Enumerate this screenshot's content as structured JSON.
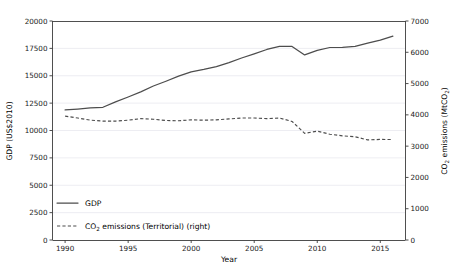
{
  "chart_data": {
    "type": "line",
    "title": "",
    "xlabel": "Year",
    "ylabel": "GDP (US$2010)",
    "y2label": "CO2 emissions (MtCO2)",
    "ylabel_parts": {
      "main": "GDP (US$2010)"
    },
    "y2label_parts": {
      "pre": "CO",
      "sub1": "2",
      "mid": " emissions (MtCO",
      "sub2": "2",
      "post": ")"
    },
    "grid": true,
    "legend_position": "lower left",
    "xlim": [
      1989,
      2017
    ],
    "ylim": [
      0,
      20000
    ],
    "y2lim": [
      0,
      7000
    ],
    "xticks": [
      1990,
      1995,
      2000,
      2005,
      2010,
      2015
    ],
    "xtick_labels": [
      "1990",
      "1995",
      "2000",
      "2005",
      "2010",
      "2015"
    ],
    "yticks": [
      0,
      2500,
      5000,
      7500,
      10000,
      12500,
      15000,
      17500,
      20000
    ],
    "ytick_labels": [
      "0",
      "2500",
      "5000",
      "7500",
      "10000",
      "12500",
      "15000",
      "17500",
      "20000"
    ],
    "y2ticks": [
      0,
      1000,
      2000,
      3000,
      4000,
      5000,
      6000,
      7000
    ],
    "y2tick_labels": [
      "0",
      "1000",
      "2000",
      "3000",
      "4000",
      "5000",
      "6000",
      "7000"
    ],
    "x": [
      1990,
      1991,
      1992,
      1993,
      1994,
      1995,
      1996,
      1997,
      1998,
      1999,
      2000,
      2001,
      2002,
      2003,
      2004,
      2005,
      2006,
      2007,
      2008,
      2009,
      2010,
      2011,
      2012,
      2013,
      2014,
      2015,
      2016
    ],
    "series": [
      {
        "name": "GDP",
        "legend_label": "GDP",
        "axis": "left",
        "style": "solid",
        "color": "#4d4d4d",
        "units": "US$2010",
        "values": [
          11880,
          11960,
          12060,
          12120,
          12620,
          13060,
          13530,
          14060,
          14500,
          14960,
          15360,
          15580,
          15840,
          16200,
          16620,
          17000,
          17400,
          17680,
          17680,
          16900,
          17320,
          17580,
          17600,
          17680,
          17980,
          18260,
          18620
        ]
      },
      {
        "name": "CO2 emissions (Territorial)",
        "legend_label_parts": {
          "pre": "CO",
          "sub": "2",
          "post": " emissions (Territorial) (right)"
        },
        "legend_label": "CO2 emissions (Territorial) (right)",
        "axis": "right",
        "style": "dashed",
        "color": "#4d4d4d",
        "units": "MtCO2",
        "values": [
          3960,
          3900,
          3830,
          3800,
          3800,
          3830,
          3880,
          3860,
          3820,
          3810,
          3840,
          3830,
          3840,
          3870,
          3900,
          3900,
          3880,
          3900,
          3790,
          3410,
          3480,
          3380,
          3330,
          3300,
          3200,
          3215,
          3210
        ]
      }
    ],
    "annotations": []
  }
}
